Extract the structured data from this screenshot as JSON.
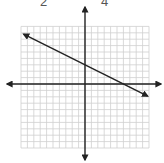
{
  "top_labels": [
    {
      "text": "2",
      "x": 43
    },
    {
      "text": "4",
      "x": 104
    }
  ],
  "graph": {
    "type": "coordinate-plane-line",
    "grid": {
      "cells_x": 20,
      "cells_y": 19,
      "unit_px": 6.4
    },
    "axes": {
      "x_range": [
        -10,
        10
      ],
      "y_range": [
        -10,
        9
      ]
    },
    "line": {
      "equation": "y = -1/2 x + 3",
      "slope": -0.5,
      "y_intercept": 3,
      "x_intercept": 6,
      "arrows": "both"
    },
    "colors": {
      "grid": "#cfcfcf",
      "axis": "#222222",
      "line": "#222222"
    }
  }
}
